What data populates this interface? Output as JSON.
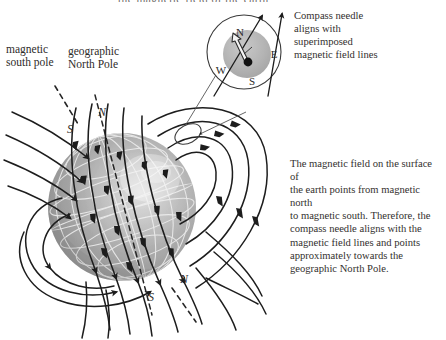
{
  "figure": {
    "domain_title": "Earth's magnetic field and compass alignment",
    "topcut_text": "the magnetic field of the earth"
  },
  "labels": {
    "magnetic_south_pole": "magnetic\nsouth pole",
    "magnetic_south_pole_line1": "magnetic",
    "magnetic_south_pole_line2": "south pole",
    "geographic_north_pole_line1": "geographic",
    "geographic_north_pole_line2": "North Pole",
    "pole_S_top": "S",
    "pole_N_top": "N",
    "pole_S_bottom": "S",
    "pole_N_bottom": "N"
  },
  "compass": {
    "north": "N",
    "east": "E",
    "south": "S",
    "west": "W",
    "caption_line1": "Compass needle",
    "caption_line2": "aligns with",
    "caption_line3": "superimposed",
    "caption_line4": "magnetic field lines"
  },
  "body_text": {
    "line1": "The magnetic field on the surface of",
    "line2": "the earth points from magnetic north",
    "line3": "to magnetic south. Therefore, the",
    "line4": "compass needle aligns with the",
    "line5": "magnetic field lines and points",
    "line6": "approximately towards the",
    "line7": "geographic North Pole."
  },
  "colors": {
    "earth_base": "#a8a8a8",
    "earth_shadow": "#8d8d8d",
    "earth_highlight": "#dcdcdc",
    "graticule": "#f2f2f2",
    "field_line": "#1d1d1d",
    "text": "#2d2b29",
    "compass_disc": "#b4b4b4",
    "background": "#ffffff"
  }
}
